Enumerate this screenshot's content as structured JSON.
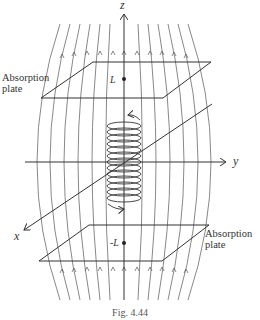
{
  "figure": {
    "caption": "Fig. 4.44",
    "axes": {
      "x": "x",
      "y": "y",
      "z": "z"
    },
    "points": {
      "top": "L",
      "bottom": "-L"
    },
    "plates": {
      "top_label_line1": "Absorption",
      "top_label_line2": "plate",
      "bottom_label_line1": "Absorption",
      "bottom_label_line2": "plate"
    },
    "colors": {
      "line": "#333333",
      "field_line": "#555555",
      "background": "#ffffff"
    }
  }
}
